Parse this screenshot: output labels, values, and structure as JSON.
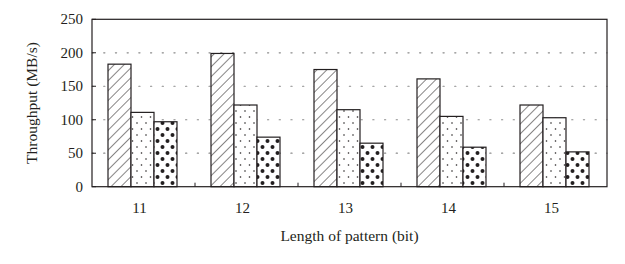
{
  "chart_data": {
    "type": "bar",
    "title": "",
    "xlabel": "Length of pattern (bit)",
    "ylabel": "Throughput (MB/s)",
    "categories": [
      "11",
      "12",
      "13",
      "14",
      "15"
    ],
    "series": [
      {
        "name": "Series 1 (diagonal hatch)",
        "pattern": "hatch",
        "values": [
          183,
          199,
          175,
          161,
          122
        ]
      },
      {
        "name": "Series 2 (sparse dots)",
        "pattern": "sparse-dots",
        "values": [
          111,
          122,
          115,
          105,
          103
        ]
      },
      {
        "name": "Series 3 (dense dots)",
        "pattern": "dense-dots",
        "values": [
          97,
          74,
          65,
          59,
          52
        ]
      }
    ],
    "ylim": [
      0,
      250
    ],
    "yticks": [
      0,
      50,
      100,
      150,
      200,
      250
    ],
    "grid": {
      "y": true,
      "style": "dotted",
      "lines": [
        50,
        100,
        150,
        200
      ]
    },
    "legend": null
  },
  "colors": {
    "ink": "#231f20",
    "background": "#ffffff",
    "grid": "#8a8a8a"
  }
}
